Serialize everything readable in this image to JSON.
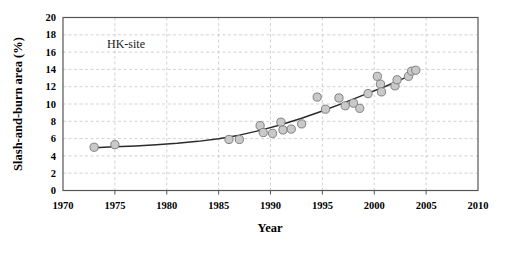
{
  "chart_data": {
    "type": "scatter",
    "title": "",
    "annotation": "HK-site",
    "xlabel": "Year",
    "ylabel": "Slash-and-burn area (%)",
    "xlim": [
      1970,
      2010
    ],
    "ylim": [
      0,
      20
    ],
    "xticks": [
      1970,
      1975,
      1980,
      1985,
      1990,
      1995,
      2000,
      2005,
      2010
    ],
    "xtick_labels": [
      "1970",
      "1975",
      "1980",
      "1985",
      "1990",
      "1995",
      "2000",
      "2005",
      "2010"
    ],
    "yticks": [
      0,
      2,
      4,
      6,
      8,
      10,
      12,
      14,
      16,
      18,
      20
    ],
    "ytick_labels": [
      "0",
      "2",
      "4",
      "6",
      "8",
      "10",
      "12",
      "14",
      "16",
      "18",
      "20"
    ],
    "grid": true,
    "grid_style": "dashed",
    "grid_color": "#c8c8c8",
    "legend": "none",
    "marker_fill": "#c9c9c9",
    "marker_stroke": "#808080",
    "trend_color": "#2b2b2b",
    "series": [
      {
        "name": "Slash-and-burn area",
        "marker": "circle",
        "points": [
          {
            "x": 1973.0,
            "y": 5.0
          },
          {
            "x": 1975.0,
            "y": 5.3
          },
          {
            "x": 1986.0,
            "y": 5.9
          },
          {
            "x": 1987.0,
            "y": 5.9
          },
          {
            "x": 1989.0,
            "y": 7.5
          },
          {
            "x": 1989.3,
            "y": 6.7
          },
          {
            "x": 1990.2,
            "y": 6.6
          },
          {
            "x": 1991.0,
            "y": 7.9
          },
          {
            "x": 1991.2,
            "y": 7.0
          },
          {
            "x": 1992.0,
            "y": 7.1
          },
          {
            "x": 1993.0,
            "y": 7.7
          },
          {
            "x": 1994.5,
            "y": 10.8
          },
          {
            "x": 1995.3,
            "y": 9.4
          },
          {
            "x": 1996.6,
            "y": 10.7
          },
          {
            "x": 1997.2,
            "y": 9.8
          },
          {
            "x": 1998.0,
            "y": 10.1
          },
          {
            "x": 1998.6,
            "y": 9.5
          },
          {
            "x": 1999.4,
            "y": 11.2
          },
          {
            "x": 2000.3,
            "y": 13.2
          },
          {
            "x": 2000.6,
            "y": 12.3
          },
          {
            "x": 2000.7,
            "y": 11.4
          },
          {
            "x": 2002.0,
            "y": 12.1
          },
          {
            "x": 2002.2,
            "y": 12.8
          },
          {
            "x": 2003.3,
            "y": 13.2
          },
          {
            "x": 2003.6,
            "y": 13.8
          },
          {
            "x": 2004.0,
            "y": 13.9
          }
        ]
      }
    ],
    "trend_line": {
      "name": "fitted trend",
      "points": [
        {
          "x": 1973.0,
          "y": 4.95
        },
        {
          "x": 1975.0,
          "y": 5.05
        },
        {
          "x": 1977.0,
          "y": 5.15
        },
        {
          "x": 1979.0,
          "y": 5.28
        },
        {
          "x": 1981.0,
          "y": 5.45
        },
        {
          "x": 1983.0,
          "y": 5.68
        },
        {
          "x": 1985.0,
          "y": 5.98
        },
        {
          "x": 1987.0,
          "y": 6.4
        },
        {
          "x": 1989.0,
          "y": 6.95
        },
        {
          "x": 1991.0,
          "y": 7.6
        },
        {
          "x": 1993.0,
          "y": 8.35
        },
        {
          "x": 1995.0,
          "y": 9.2
        },
        {
          "x": 1997.0,
          "y": 10.1
        },
        {
          "x": 1999.0,
          "y": 11.05
        },
        {
          "x": 2001.0,
          "y": 12.0
        },
        {
          "x": 2003.0,
          "y": 13.05
        },
        {
          "x": 2004.2,
          "y": 13.75
        }
      ]
    }
  }
}
